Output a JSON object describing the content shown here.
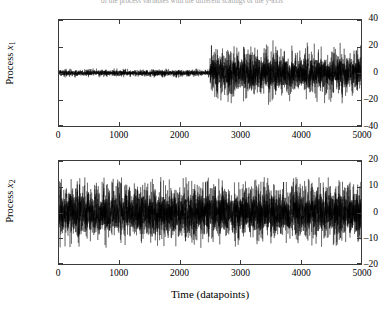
{
  "caption": {
    "text": "of the process variables with the different scalings of the y-axis"
  },
  "figure": {
    "background": "#ffffff",
    "line_color": "#000000",
    "axis_color": "#3a3a3a"
  },
  "panels": [
    {
      "id": "top",
      "y_axis_title_prefix": "Process ",
      "y_axis_title_var": "x",
      "y_axis_title_sub": "1",
      "y_ticks": [
        "40",
        "20",
        "0",
        "–20",
        "–40"
      ],
      "x_ticks": [
        "0",
        "1000",
        "2000",
        "3000",
        "4000",
        "5000"
      ]
    },
    {
      "id": "bottom",
      "y_axis_title_prefix": "Process ",
      "y_axis_title_var": "x",
      "y_axis_title_sub": "2",
      "y_ticks": [
        "20",
        "10",
        "0",
        "–10",
        "–20"
      ],
      "x_ticks": [
        "0",
        "1000",
        "2000",
        "3000",
        "4000",
        "5000"
      ]
    }
  ],
  "x_axis_label": "Time (datapoints)",
  "chart_data": [
    {
      "type": "line",
      "id": "process-x1",
      "title": "",
      "xlabel": "Time (datapoints)",
      "ylabel": "Process x1",
      "xlim": [
        0,
        5000
      ],
      "ylim": [
        -40,
        40
      ],
      "xticks": [
        0,
        1000,
        2000,
        3000,
        4000,
        5000
      ],
      "yticks": [
        -40,
        -20,
        0,
        20,
        40
      ],
      "grid": false,
      "legend": "none",
      "series_description": "Zero-mean random noise. Low variance segment for t in [0,2500] with amplitude about +/-3; abrupt variance increase at t = 2500 with amplitude about +/-18 and extreme excursions to about +/-27 for t in [2500,5000].",
      "change_point": 2500,
      "segments": [
        {
          "x_start": 0,
          "x_end": 2500,
          "mean": 0,
          "std": 1.0,
          "typical_abs_peak": 3
        },
        {
          "x_start": 2500,
          "x_end": 5000,
          "mean": 0,
          "std": 6.5,
          "typical_abs_peak": 20
        }
      ],
      "n_points": 5000
    },
    {
      "type": "line",
      "id": "process-x2",
      "title": "",
      "xlabel": "Time (datapoints)",
      "ylabel": "Process x2",
      "xlim": [
        0,
        5000
      ],
      "ylim": [
        -20,
        20
      ],
      "xticks": [
        0,
        1000,
        2000,
        3000,
        4000,
        5000
      ],
      "yticks": [
        -20,
        -10,
        0,
        10,
        20
      ],
      "grid": false,
      "legend": "none",
      "series_description": "Zero-mean random noise with constant variance across the full record; amplitude about +/-10 typical with excursions to about +/-17.",
      "change_point": null,
      "segments": [
        {
          "x_start": 0,
          "x_end": 5000,
          "mean": 0,
          "std": 4.2,
          "typical_abs_peak": 12
        }
      ],
      "n_points": 5000
    }
  ]
}
